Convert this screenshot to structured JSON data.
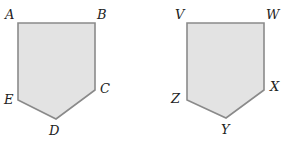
{
  "diagram": {
    "fill_color": "#e3e3e3",
    "stroke_color": "#8a8a8a",
    "pentagons": [
      {
        "name": "ABCDE",
        "vertices": [
          {
            "label": "A",
            "x": 18,
            "y": 23,
            "lx": 5,
            "ly": 19
          },
          {
            "label": "B",
            "x": 95,
            "y": 23,
            "lx": 97,
            "ly": 19
          },
          {
            "label": "C",
            "x": 95,
            "y": 90,
            "lx": 100,
            "ly": 93
          },
          {
            "label": "D",
            "x": 56,
            "y": 119,
            "lx": 49,
            "ly": 135
          },
          {
            "label": "E",
            "x": 18,
            "y": 100,
            "lx": 4,
            "ly": 104
          }
        ]
      },
      {
        "name": "VWXYZ",
        "vertices": [
          {
            "label": "V",
            "x": 187,
            "y": 23,
            "lx": 175,
            "ly": 19
          },
          {
            "label": "W",
            "x": 264,
            "y": 23,
            "lx": 266,
            "ly": 19
          },
          {
            "label": "X",
            "x": 264,
            "y": 90,
            "lx": 270,
            "ly": 91
          },
          {
            "label": "Y",
            "x": 226,
            "y": 118,
            "lx": 221,
            "ly": 134
          },
          {
            "label": "Z",
            "x": 187,
            "y": 100,
            "lx": 171,
            "ly": 103
          }
        ]
      }
    ]
  }
}
